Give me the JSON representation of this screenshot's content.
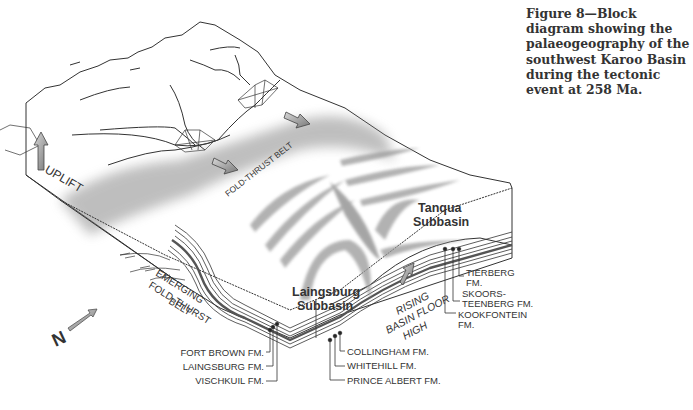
{
  "caption": {
    "text": "Figure 8—Block diagram showing the palaeogeography of the southwest Karoo Basin during the tectonic event at 258 Ma."
  },
  "labels": {
    "uplift": "UPLIFT",
    "fold_thrust_belt": "FOLD-THRUST BELT",
    "emerging_1": "EMERGING",
    "emerging_2": "FOLD-THURST",
    "emerging_3": "BELT",
    "tanqua_1": "Tanqua",
    "tanqua_2": "Subbasin",
    "laingsburg_1": "Laingsburg",
    "laingsburg_2": "Subbasin",
    "rising_1": "RISING",
    "rising_2": "BASIN FLOOR",
    "rising_3": "HIGH",
    "north": "N"
  },
  "formations_left": [
    "FORT BROWN FM.",
    "LAINGSBURG FM.",
    "VISCHKUIL FM."
  ],
  "formations_center": [
    "COLLINGHAM FM.",
    "WHITEHILL FM.",
    "PRINCE ALBERT FM."
  ],
  "formations_right": [
    {
      "line1": "TIERBERG",
      "line2": "FM."
    },
    {
      "line1": "SKOORS-",
      "line2": "TEENBERG FM."
    },
    {
      "line1": "KOOKFONTEIN",
      "line2": "FM."
    }
  ],
  "colors": {
    "line": "#333333",
    "shade": "#9a9a9a",
    "arrow_fill": "#a8a8a8"
  }
}
